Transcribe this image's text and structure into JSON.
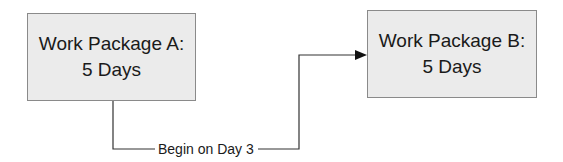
{
  "diagram": {
    "nodes": [
      {
        "id": "A",
        "title": "Work Package A:",
        "duration": "5 Days"
      },
      {
        "id": "B",
        "title": "Work Package B:",
        "duration": "5 Days"
      }
    ],
    "edges": [
      {
        "from": "A",
        "to": "B",
        "label": "Begin on Day 3"
      }
    ],
    "colors": {
      "box_fill": "#ebebeb",
      "box_border": "#8a8a8a",
      "line": "#333333"
    }
  }
}
